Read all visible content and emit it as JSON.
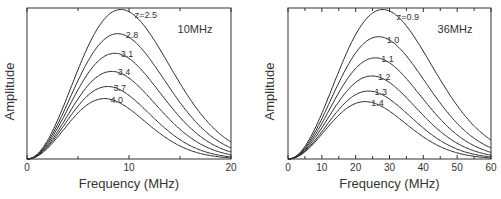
{
  "chart_data": [
    {
      "type": "line",
      "title": "",
      "panel_label": "10MHz",
      "xlabel": "Frequency (MHz)",
      "ylabel": "Amplitude",
      "xlim": [
        0,
        20
      ],
      "ylim": [
        0,
        1
      ],
      "xticks": [
        0,
        10,
        20
      ],
      "xticks_minor": [
        5,
        15
      ],
      "grid": false,
      "legend": "inline curve labels",
      "series": [
        {
          "name": "z=2.5",
          "label": "z=2.5",
          "peak_freq": 9.2,
          "peak_amp": 0.99
        },
        {
          "name": "z=2.8",
          "label": "2.8",
          "peak_freq": 8.9,
          "peak_amp": 0.83
        },
        {
          "name": "z=3.1",
          "label": "3.1",
          "peak_freq": 8.6,
          "peak_amp": 0.7
        },
        {
          "name": "z=3.4",
          "label": "3.4",
          "peak_freq": 8.3,
          "peak_amp": 0.58
        },
        {
          "name": "z=3.7",
          "label": "3.7",
          "peak_freq": 7.9,
          "peak_amp": 0.48
        },
        {
          "name": "z=4.0",
          "label": "4.0",
          "peak_freq": 7.6,
          "peak_amp": 0.4
        }
      ]
    },
    {
      "type": "line",
      "title": "",
      "panel_label": "36MHz",
      "xlabel": "Frequency (MHz)",
      "ylabel": "Amplitude",
      "xlim": [
        0,
        60
      ],
      "ylim": [
        0,
        1
      ],
      "xticks": [
        0,
        10,
        20,
        30,
        40,
        50,
        60
      ],
      "xticks_minor": [
        5,
        15,
        25,
        35,
        45,
        55
      ],
      "grid": false,
      "legend": "inline curve labels",
      "series": [
        {
          "name": "z=0.9",
          "label": "z=0.9",
          "peak_freq": 28.0,
          "peak_amp": 0.99
        },
        {
          "name": "z=1.0",
          "label": "1.0",
          "peak_freq": 26.8,
          "peak_amp": 0.81
        },
        {
          "name": "z=1.1",
          "label": "1.1",
          "peak_freq": 25.8,
          "peak_amp": 0.67
        },
        {
          "name": "z=1.2",
          "label": "1.2",
          "peak_freq": 24.8,
          "peak_amp": 0.55
        },
        {
          "name": "z=1.3",
          "label": "1.3",
          "peak_freq": 23.8,
          "peak_amp": 0.45
        },
        {
          "name": "z=1.4",
          "label": "1.4",
          "peak_freq": 22.8,
          "peak_amp": 0.38
        }
      ]
    }
  ]
}
